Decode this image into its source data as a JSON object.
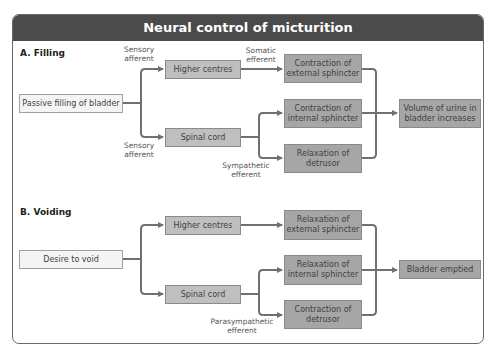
{
  "title": "Neural control of micturition",
  "colors": {
    "header": "#4b4b4b",
    "box_light": "#f4f4f4",
    "box_mid": "#bfbfbf",
    "box_dark": "#a6a6a6",
    "arrow": "#707070"
  },
  "filling": {
    "label": "A. Filling",
    "source": "Passive filling of bladder",
    "sensory_top": "Sensory afferent",
    "sensory_bottom": "Sensory afferent",
    "higher_centres": "Higher centres",
    "spinal_cord": "Spinal cord",
    "somatic": "Somatic efferent",
    "sympathetic": "Sympathetic efferent",
    "external": "Contraction of external sphincter",
    "internal": "Contraction of internal sphincter",
    "detrusor": "Relaxation of detrusor",
    "outcome": "Volume of urine in bladder increases"
  },
  "voiding": {
    "label": "B. Voiding",
    "source": "Desire to void",
    "higher_centres": "Higher centres",
    "spinal_cord": "Spinal cord",
    "parasympathetic": "Parasympathetic efferent",
    "external": "Relaxation of external sphincter",
    "internal": "Relaxation of internal sphincter",
    "detrusor": "Contraction of detrusor",
    "outcome": "Bladder emptied"
  }
}
